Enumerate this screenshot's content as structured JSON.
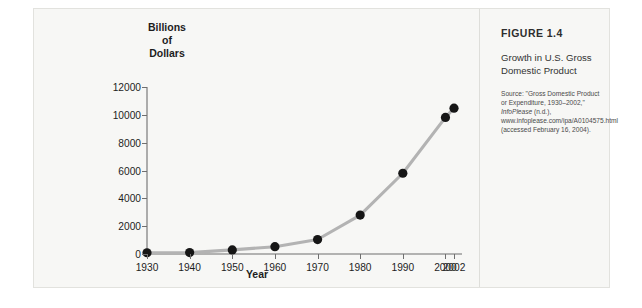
{
  "figure": {
    "number": "FIGURE 1.4",
    "title": "Growth in U.S. Gross Domestic Product",
    "source": "Source: \"Gross Domestic Product or Expenditure, 1930–2002,\" InfoPlease (n.d.), www.infoplease.com/ipa/A0104575.html (accessed February 16, 2004).",
    "source_parts": {
      "lead": "Source: \"Gross Domestic Product or Expenditure, 1930–2002,\" ",
      "italic": "InfoPlease",
      "tail": " (n.d.), www.infoplease.com/ipa/A0104575.html (accessed February 16, 2004)."
    }
  },
  "colors": {
    "page_background": "#ffffff",
    "card_background": "#f7f7f5",
    "card_border": "#e2e2de",
    "divider": "#dededa",
    "line": "#b3b3b3",
    "marker": "#161616",
    "axis": "#6f6f6f",
    "text": "#1d1d1d",
    "caption_text": "#333333"
  },
  "chart_data": {
    "type": "line",
    "title": "Growth in U.S. Gross Domestic Product",
    "xlabel": "Year",
    "ylabel": "Billions of Dollars",
    "ylabel_lines": [
      "Billions",
      "of",
      "Dollars"
    ],
    "categories": [
      "1930",
      "1940",
      "1950",
      "1960",
      "1970",
      "1980",
      "1990",
      "2000",
      "2002"
    ],
    "x": [
      1930,
      1940,
      1950,
      1960,
      1970,
      1980,
      1990,
      2000,
      2002
    ],
    "values": [
      91,
      100,
      294,
      526,
      1040,
      2796,
      5803,
      9817,
      10480
    ],
    "series": [
      {
        "name": "U.S. Gross Domestic Product",
        "values": [
          91,
          100,
          294,
          526,
          1040,
          2796,
          5803,
          9817,
          10480
        ]
      }
    ],
    "ylim": [
      0,
      12000
    ],
    "yticks": [
      0,
      2000,
      4000,
      6000,
      8000,
      10000,
      12000
    ],
    "ytick_labels": [
      "0",
      "2000",
      "4000",
      "6000",
      "8000",
      "10000",
      "12000"
    ],
    "xticks": [
      1930,
      1940,
      1950,
      1960,
      1970,
      1980,
      1990,
      2000,
      2002
    ],
    "grid": false,
    "legend": false,
    "marker": "circle"
  }
}
